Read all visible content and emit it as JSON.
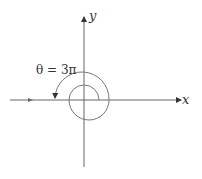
{
  "diagram": {
    "x_axis_label": "x",
    "y_axis_label": "y",
    "angle_label": "θ = 3π",
    "colors": {
      "line": "#555555",
      "background": "#ffffff"
    }
  }
}
